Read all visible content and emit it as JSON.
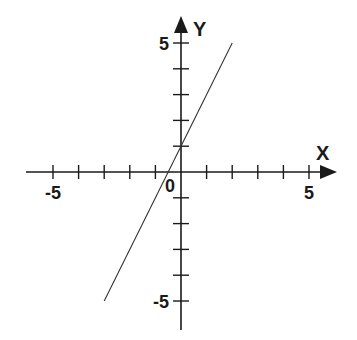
{
  "chart_data": {
    "type": "line",
    "title": "",
    "xlabel": "X",
    "ylabel": "Y",
    "xlim": [
      -5,
      5
    ],
    "ylim": [
      -5,
      5
    ],
    "grid": false,
    "x_tick_labels": [
      {
        "value": -5,
        "label": "-5"
      },
      {
        "value": 0,
        "label": "0"
      },
      {
        "value": 5,
        "label": "5"
      }
    ],
    "y_tick_labels": [
      {
        "value": 5,
        "label": "5"
      },
      {
        "value": -5,
        "label": "-5"
      }
    ],
    "series": [
      {
        "name": "y = 2x + 1",
        "x": [
          -3,
          2
        ],
        "y": [
          -5,
          5
        ],
        "style": "thin"
      }
    ],
    "colors": {
      "axis": "#1a1a1a",
      "line": "#333333"
    }
  }
}
